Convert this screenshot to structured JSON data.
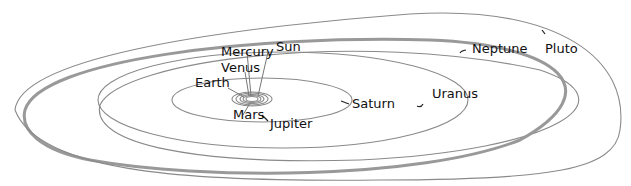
{
  "diagram": {
    "center": {
      "x": 250,
      "y": 99
    },
    "labels": {
      "sun": "Sun",
      "mercury": "Mercury",
      "venus": "Venus",
      "earth": "Earth",
      "mars": "Mars",
      "jupiter": "Jupiter",
      "saturn": "Saturn",
      "uranus": "Uranus",
      "neptune": "Neptune",
      "pluto": "Pluto"
    },
    "orbit_color": "#8a8a8a",
    "text_color": "#111111"
  }
}
